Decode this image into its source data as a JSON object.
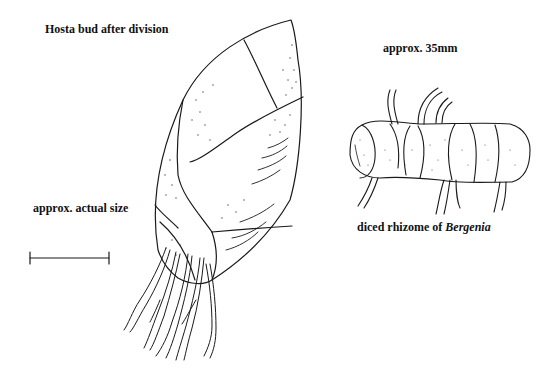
{
  "figure": {
    "hosta": {
      "title": "Hosta bud after division",
      "scale_label": "approx. actual size"
    },
    "bergenia": {
      "size_label": "approx. 35mm",
      "caption_prefix": "diced rhizome of ",
      "caption_genus": "Bergenia"
    },
    "colors": {
      "ink": "#111111",
      "background": "#ffffff"
    }
  }
}
